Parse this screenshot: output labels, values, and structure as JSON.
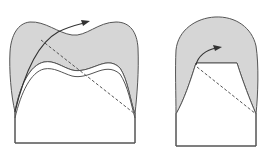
{
  "diagram": {
    "description": "Two tooth-like cross-section schematics: each has a gray shaded crown layer over a white core on a rectangular base, with a curved solid arrow and a dashed diagonal line.",
    "colors": {
      "shade": "#d6d6d6",
      "stroke": "#555555",
      "arrow": "#333333",
      "background": "#ffffff"
    },
    "figures": [
      {
        "id": "left",
        "label": "",
        "shape": "bicuspid crown with double inner contour",
        "elements": [
          "shaded-crown",
          "inner-double-contour",
          "base-rectangle",
          "curved-arrow",
          "dashed-line"
        ]
      },
      {
        "id": "right",
        "label": "",
        "shape": "dome crown over trapezoid core",
        "elements": [
          "shaded-crown",
          "trapezoid-core",
          "base-rectangle",
          "curved-arrow",
          "dashed-line"
        ]
      }
    ]
  }
}
